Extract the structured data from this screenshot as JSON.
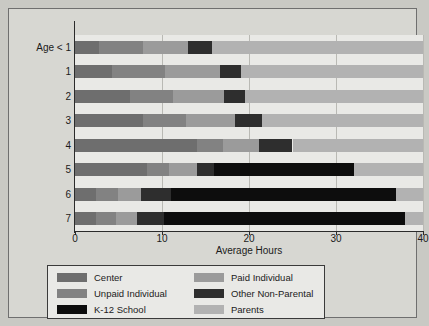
{
  "chart_data": {
    "type": "bar",
    "orientation": "horizontal",
    "stacked": true,
    "title": "",
    "xlabel": "Average Hours",
    "ylabel": "",
    "xlim": [
      0,
      40
    ],
    "xticks": [
      0,
      10,
      20,
      30,
      40
    ],
    "xtick_labels": [
      "0",
      "10",
      "20",
      "30",
      "40"
    ],
    "grid": true,
    "grid_axis": "x",
    "legend_position": "bottom",
    "legend_columns": 2,
    "categories": [
      "Age < 1",
      "1",
      "2",
      "3",
      "4",
      "5",
      "6",
      "7"
    ],
    "series": [
      {
        "name": "Center",
        "color": "#6e6e6e",
        "values": [
          2.8,
          4.3,
          6.3,
          7.8,
          14.0,
          8.3,
          2.4,
          2.4
        ]
      },
      {
        "name": "Unpaid Individual",
        "color": "#828282",
        "values": [
          5.0,
          6.0,
          5.0,
          5.0,
          3.0,
          2.5,
          2.5,
          2.3
        ]
      },
      {
        "name": "Paid Individual",
        "color": "#9b9b9b",
        "values": [
          5.2,
          6.4,
          5.8,
          5.6,
          4.2,
          3.2,
          2.7,
          2.4
        ]
      },
      {
        "name": "Other Non-Parental",
        "color": "#2e2e2e",
        "values": [
          2.7,
          2.4,
          2.4,
          3.1,
          3.8,
          2.0,
          3.4,
          3.1
        ]
      },
      {
        "name": "K-12 School",
        "color": "#0d0d0d",
        "values": [
          0.0,
          0.0,
          0.0,
          0.0,
          0.0,
          16.1,
          25.9,
          27.7
        ]
      },
      {
        "name": "Parents",
        "color": "#b2b2b2",
        "values": [
          24.3,
          20.9,
          20.5,
          18.5,
          15.0,
          7.9,
          3.1,
          2.1
        ]
      }
    ],
    "totals": [
      40,
      40,
      40,
      40,
      40,
      40,
      40,
      40
    ],
    "segment_order": [
      "Center",
      "Unpaid Individual",
      "Paid Individual",
      "Other Non-Parental",
      "K-12 School",
      "Parents"
    ]
  },
  "axis": {
    "x_title": "Average Hours",
    "x_tick_labels": [
      "0",
      "10",
      "20",
      "30",
      "40"
    ],
    "y_tick_labels": [
      "Age < 1",
      "1",
      "2",
      "3",
      "4",
      "5",
      "6",
      "7"
    ]
  },
  "legend": {
    "items": [
      {
        "label": "Center",
        "color": "#6e6e6e"
      },
      {
        "label": "Paid Individual",
        "color": "#9b9b9b"
      },
      {
        "label": "Unpaid Individual",
        "color": "#828282"
      },
      {
        "label": "Other Non-Parental",
        "color": "#2e2e2e"
      },
      {
        "label": "K-12 School",
        "color": "#0d0d0d"
      },
      {
        "label": "Parents",
        "color": "#b2b2b2"
      }
    ]
  },
  "colors": {
    "plot_background": "#e9e9e6",
    "page_background": "#c9c9c4",
    "plate_background": "#d7d7d2",
    "axis": "#2b2b2b",
    "gridline": "#b9b9b4",
    "text": "#1b1b1b"
  }
}
